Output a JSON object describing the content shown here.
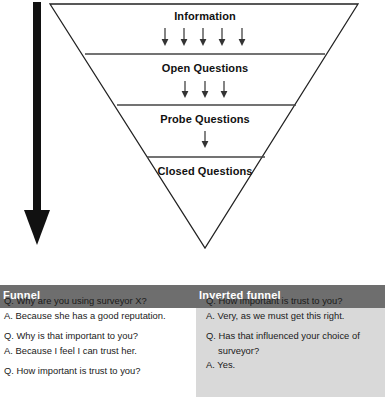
{
  "diagram": {
    "name": "inverted-funnel-questioning-diagram",
    "flow_arrow": "downward-arrow",
    "sections": [
      {
        "label": "Information",
        "arrows": 5
      },
      {
        "label": "Open Questions",
        "arrows": 3
      },
      {
        "label": "Probe Questions",
        "arrows": 1
      },
      {
        "label": "Closed Questions",
        "arrows": 0
      }
    ]
  },
  "table": {
    "columns": [
      {
        "header": "Funnel"
      },
      {
        "header": "Inverted funnel"
      }
    ],
    "left_lines": [
      {
        "text": "Q. Why are you using surveyor X?",
        "style": ""
      },
      {
        "text": "A. Because she has a good reputation.",
        "style": ""
      },
      {
        "text": "Q. Why is that important to you?",
        "style": "gap-before"
      },
      {
        "text": "A. Because I feel I can trust her.",
        "style": ""
      },
      {
        "text": "Q. How important is trust to you?",
        "style": "gap-before"
      }
    ],
    "right_lines": [
      {
        "text": "Q. How important is trust to you?",
        "style": ""
      },
      {
        "text": "A. Very, as we must get this right.",
        "style": ""
      },
      {
        "text": "Q. Has that influenced your choice of",
        "style": "gap-before"
      },
      {
        "text": "surveyor?",
        "style": "continuation"
      },
      {
        "text": "A. Yes.",
        "style": ""
      }
    ]
  },
  "colors": {
    "header_band": "#6e6e6e",
    "right_column_background": "#d9d9d9",
    "diagram_outline": "#222222",
    "flow_arrow": "#111111",
    "text": "#1a1a1a"
  }
}
